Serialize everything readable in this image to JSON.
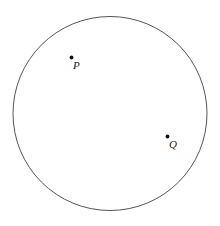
{
  "figure": {
    "canvas": {
      "width": 220,
      "height": 226,
      "background_color": "#ffffff"
    },
    "shapes": [
      {
        "name": "circle",
        "type": "circle",
        "cx": 110,
        "cy": 113.5,
        "r": 97,
        "stroke_color": "#555555",
        "stroke_width": 1,
        "fill": "none"
      }
    ],
    "points": [
      {
        "name": "point-p",
        "label": "P",
        "dot_x": 71.5,
        "dot_y": 57.5,
        "dot_radius": 1.9,
        "dot_color": "#111111",
        "label_x": 73,
        "label_y": 60
      },
      {
        "name": "point-q",
        "label": "Q",
        "dot_x": 167.5,
        "dot_y": 136.5,
        "dot_radius": 1.9,
        "dot_color": "#111111",
        "label_x": 169,
        "label_y": 139
      }
    ]
  }
}
